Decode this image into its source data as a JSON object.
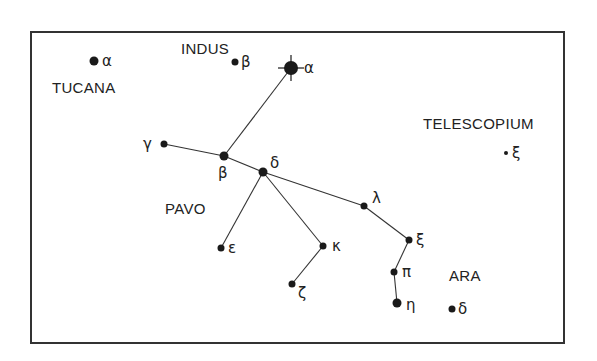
{
  "colors": {
    "ink": "#1a1a1a",
    "line": "#333333",
    "frame": "#333333",
    "background": "#ffffff"
  },
  "constellations": [
    {
      "id": "tucana",
      "name": "TUCANA"
    },
    {
      "id": "indus",
      "name": "INDUS"
    },
    {
      "id": "telescopium",
      "name": "TELESCOPIUM"
    },
    {
      "id": "pavo",
      "name": "PAVO"
    },
    {
      "id": "ara",
      "name": "ARA"
    }
  ],
  "stars": [
    {
      "id": "tuc-alpha",
      "constellation": "Tucana",
      "greek": "α",
      "magnitude_class": "medium"
    },
    {
      "id": "ind-beta",
      "constellation": "Indus",
      "greek": "β",
      "magnitude_class": "small"
    },
    {
      "id": "pav-alpha",
      "constellation": "Pavo",
      "greek": "α",
      "magnitude_class": "brightest"
    },
    {
      "id": "pav-gamma",
      "constellation": "Pavo",
      "greek": "γ",
      "magnitude_class": "small"
    },
    {
      "id": "pav-beta",
      "constellation": "Pavo",
      "greek": "β",
      "magnitude_class": "medium"
    },
    {
      "id": "pav-delta",
      "constellation": "Pavo",
      "greek": "δ",
      "magnitude_class": "medium"
    },
    {
      "id": "pav-epsilon",
      "constellation": "Pavo",
      "greek": "ε",
      "magnitude_class": "small"
    },
    {
      "id": "pav-kappa",
      "constellation": "Pavo",
      "greek": "κ",
      "magnitude_class": "small"
    },
    {
      "id": "pav-zeta",
      "constellation": "Pavo",
      "greek": "ζ",
      "magnitude_class": "small"
    },
    {
      "id": "pav-lambda",
      "constellation": "Pavo",
      "greek": "λ",
      "magnitude_class": "small"
    },
    {
      "id": "pav-xi",
      "constellation": "Pavo",
      "greek": "ξ",
      "magnitude_class": "small"
    },
    {
      "id": "pav-pi",
      "constellation": "Pavo",
      "greek": "π",
      "magnitude_class": "small"
    },
    {
      "id": "pav-eta",
      "constellation": "Pavo",
      "greek": "η",
      "magnitude_class": "medium"
    },
    {
      "id": "ara-delta",
      "constellation": "Ara",
      "greek": "δ",
      "magnitude_class": "small"
    },
    {
      "id": "tel-xi",
      "constellation": "Telescopium",
      "greek": "ξ",
      "magnitude_class": "faint"
    }
  ],
  "lines": [
    [
      "pav-alpha",
      "pav-beta"
    ],
    [
      "pav-gamma",
      "pav-beta"
    ],
    [
      "pav-beta",
      "pav-delta"
    ],
    [
      "pav-delta",
      "pav-epsilon"
    ],
    [
      "pav-delta",
      "pav-kappa"
    ],
    [
      "pav-kappa",
      "pav-zeta"
    ],
    [
      "pav-delta",
      "pav-lambda"
    ],
    [
      "pav-lambda",
      "pav-xi"
    ],
    [
      "pav-xi",
      "pav-pi"
    ],
    [
      "pav-pi",
      "pav-eta"
    ]
  ]
}
